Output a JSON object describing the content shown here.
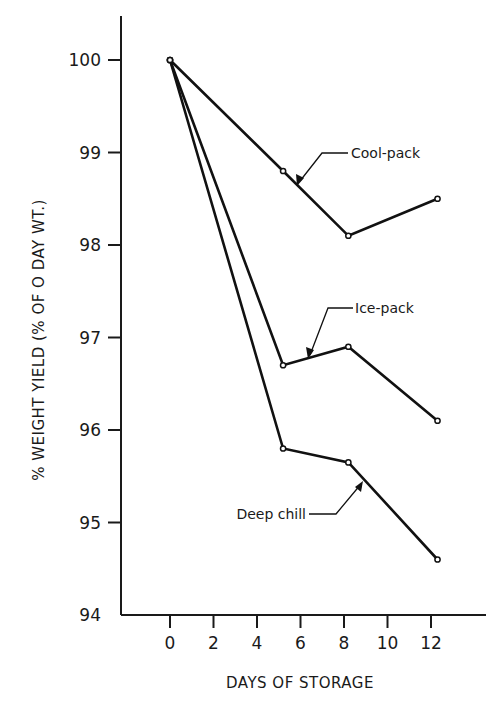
{
  "chart_data": {
    "type": "line",
    "title": "",
    "xlabel": "DAYS OF STORAGE",
    "ylabel": "% WEIGHT YIELD (% OF O DAY WT.)",
    "xlim": [
      -1.5,
      14
    ],
    "ylim": [
      94,
      100.5
    ],
    "x_ticks": [
      0,
      2,
      4,
      6,
      8,
      10,
      12
    ],
    "x_tick_labels": [
      "0",
      "2",
      "4",
      "6",
      "8",
      "10",
      "12"
    ],
    "y_ticks": [
      94,
      95,
      96,
      97,
      98,
      99,
      100
    ],
    "y_tick_labels": [
      "94",
      "95",
      "96",
      "97",
      "98",
      "99",
      "100"
    ],
    "grid": false,
    "legend_position": "inline annotations with leader arrows",
    "series": [
      {
        "name": "Cool-pack",
        "x": [
          0,
          5.2,
          8.2,
          12.3
        ],
        "values": [
          100,
          98.8,
          98.1,
          98.5
        ]
      },
      {
        "name": "Ice-pack",
        "x": [
          0,
          5.2,
          8.2,
          12.3
        ],
        "values": [
          100,
          96.7,
          96.9,
          96.1
        ]
      },
      {
        "name": "Deep chill",
        "x": [
          0,
          5.2,
          8.2,
          12.3
        ],
        "values": [
          100,
          95.8,
          95.65,
          94.6
        ]
      }
    ]
  },
  "labels": {
    "cool_pack": "Cool-pack",
    "ice_pack": "Ice-pack",
    "deep_chill": "Deep chill",
    "x_axis_title": "DAYS OF STORAGE",
    "y_axis_title": "% WEIGHT YIELD (% OF O DAY WT.)"
  }
}
